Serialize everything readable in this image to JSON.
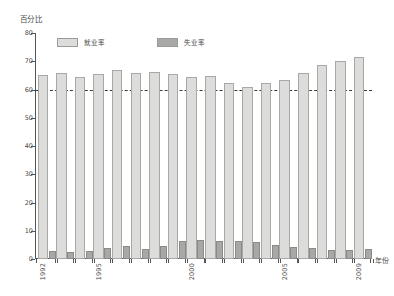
{
  "chart_data": {
    "type": "bar",
    "title": "",
    "subtitle": "",
    "xlabel": "年份",
    "ylabel": "百分比",
    "ylim": [
      0,
      80
    ],
    "ytick_step": 10,
    "yticks": [
      "0",
      "10",
      "20",
      "30",
      "40",
      "50",
      "60",
      "70",
      "80"
    ],
    "grid": false,
    "legend_position": "top-left-inside",
    "categories": [
      "1992",
      "1993",
      "1994",
      "1995",
      "1996",
      "1997",
      "1998",
      "1999",
      "2000",
      "2001",
      "2002",
      "2003",
      "2004",
      "2005",
      "2006",
      "2007",
      "2008",
      "2009"
    ],
    "xtick_labels_shown": [
      "1992",
      "1995",
      "2000",
      "2005",
      "2009"
    ],
    "series": [
      {
        "name": "就业率",
        "color": "#dcdcda",
        "values": [
          65.2,
          65.7,
          64.4,
          65.5,
          66.8,
          66.0,
          66.1,
          65.6,
          64.4,
          64.8,
          62.3,
          61.0,
          62.4,
          63.2,
          65.8,
          68.8,
          70.2,
          71.5
        ]
      },
      {
        "name": "失业率",
        "color": "#a8a8a6",
        "values": [
          2.8,
          2.5,
          2.9,
          3.9,
          4.6,
          3.4,
          4.7,
          6.4,
          6.9,
          6.4,
          6.4,
          6.1,
          4.8,
          4.1,
          3.8,
          3.2,
          3.1,
          3.5
        ]
      }
    ],
    "annotations": [
      {
        "type": "reference-line",
        "orientation": "horizontal",
        "value": 60,
        "style": "dashed",
        "color": "#3c3c3c"
      }
    ]
  },
  "legend": {
    "items": [
      {
        "label": "就业率"
      },
      {
        "label": "失业率"
      }
    ]
  },
  "axes": {
    "y_title": "百分比",
    "x_title": "年份"
  }
}
